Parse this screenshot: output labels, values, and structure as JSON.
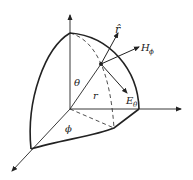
{
  "diagram": {
    "title": "",
    "labels": {
      "r_hat": "r̂",
      "h_phi": "H",
      "h_phi_sub": "ϕ",
      "e_theta": "E",
      "e_theta_sub": "θ",
      "theta": "θ",
      "r": "r",
      "phi": "ϕ"
    },
    "colors": {
      "stroke": "#222222",
      "background": "#ffffff"
    }
  }
}
